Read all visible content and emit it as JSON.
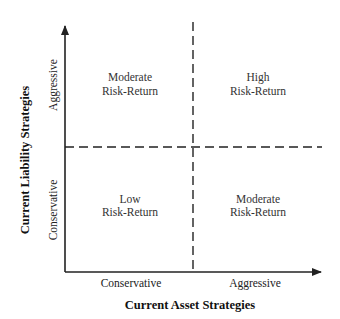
{
  "diagram": {
    "type": "quadrant-matrix",
    "x_axis": {
      "title": "Current Asset Strategies",
      "low_label": "Conservative",
      "high_label": "Aggressive"
    },
    "y_axis": {
      "title": "Current Liability Strategies",
      "low_label": "Conservative",
      "high_label": "Aggressive"
    },
    "quadrants": {
      "top_left": {
        "line1": "Moderate",
        "line2": "Risk-Return"
      },
      "top_right": {
        "line1": "High",
        "line2": "Risk-Return"
      },
      "bottom_left": {
        "line1": "Low",
        "line2": "Risk-Return"
      },
      "bottom_right": {
        "line1": "Moderate",
        "line2": "Risk-Return"
      }
    },
    "colors": {
      "line": "#222222",
      "text": "#333333"
    }
  }
}
